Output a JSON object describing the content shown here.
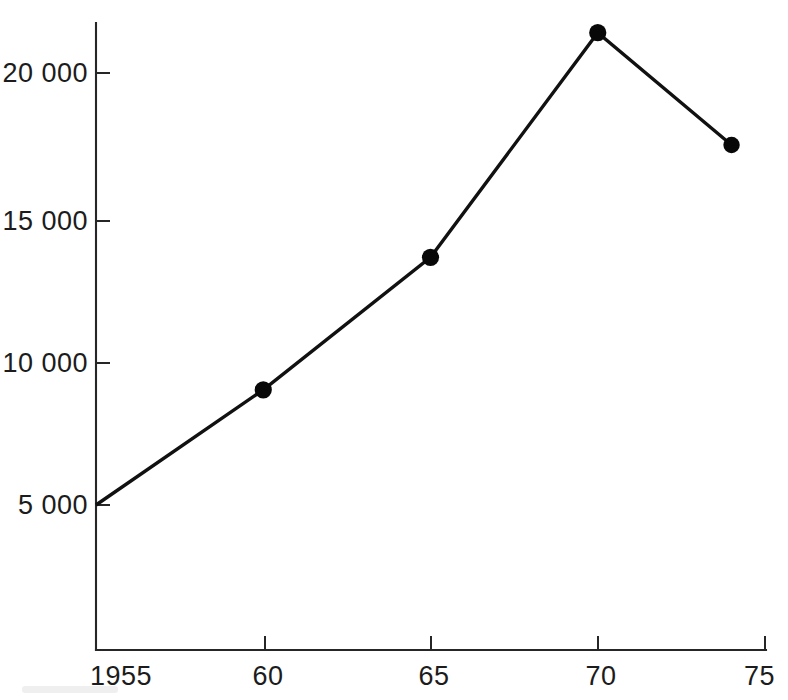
{
  "chart_data": {
    "type": "line",
    "title": "",
    "subtitle": "",
    "xlabel": "",
    "ylabel": "",
    "x": [
      1955,
      1960,
      1965,
      1970,
      1974
    ],
    "values": [
      5000,
      9000,
      13600,
      21400,
      17500
    ],
    "series": [
      {
        "name": "",
        "x": [
          1955,
          1960,
          1965,
          1970,
          1974
        ],
        "values": [
          5000,
          9000,
          13600,
          21400,
          17500
        ]
      }
    ],
    "markers": [
      false,
      true,
      true,
      true,
      true
    ],
    "xlim": [
      1955,
      1975
    ],
    "ylim": [
      0,
      22800
    ],
    "x_tick_values": [
      1955,
      1960,
      1965,
      1970,
      1975
    ],
    "x_tick_labels": [
      "1955",
      "60",
      "65",
      "70",
      "75"
    ],
    "y_tick_values": [
      5000,
      10000,
      15000,
      20000
    ],
    "y_tick_labels": [
      "5 000",
      "10 000",
      "15 000",
      "20 000"
    ],
    "grid": false,
    "legend": null,
    "legend_position": "none",
    "annotations": [],
    "line_color": "#111111",
    "marker_color": "#080808",
    "axis_color": "#262626",
    "background_color": "#ffffff"
  },
  "axes": {
    "y_axis_name": "y-axis",
    "x_axis_name": "x-axis"
  }
}
